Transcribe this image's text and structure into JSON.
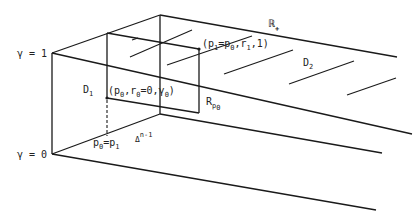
{
  "diagram": {
    "labels": {
      "gamma_top": "γ = 1",
      "gamma_bottom": "γ = 0",
      "region_d1": "D",
      "region_d1_sub": "1",
      "region_d2": "D",
      "region_d2_sub": "2",
      "real_plus": "ℝ",
      "real_plus_sub": "+",
      "simplex": "Δ",
      "simplex_sup": "n-1",
      "r_p0": "R",
      "r_p0_sub": "p",
      "r_p0_subsub": "0",
      "point_low": "(p",
      "point_low_sub0": "0",
      "point_low_mid": ",r",
      "point_low_sub1": "0",
      "point_low_end": "=0,γ",
      "point_low_sub2": "0",
      "point_low_close": ")",
      "point_high": "(p",
      "point_high_sub0": "1",
      "point_high_mid": "=p",
      "point_high_sub1": "0",
      "point_high_end": ",r",
      "point_high_sub2": "1",
      "point_high_close": ",1)",
      "base_point": "p",
      "base_point_sub0": "0",
      "base_point_eq": "=p",
      "base_point_sub1": "1"
    },
    "colors": {
      "ink": "#1a1a1a",
      "background": "#ffffff"
    }
  }
}
